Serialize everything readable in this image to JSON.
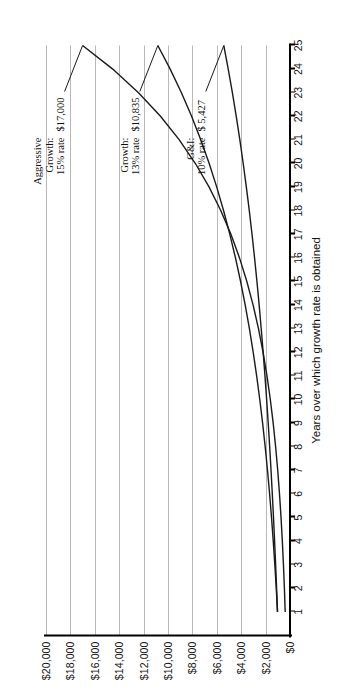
{
  "chart_data": {
    "type": "line",
    "title": "",
    "xlabel": "Years over which growth rate is obtained",
    "ylabel": "",
    "xlim": [
      0,
      25
    ],
    "ylim": [
      0,
      20000
    ],
    "grid": true,
    "legend_position": "inline-annotations",
    "x": [
      1,
      2,
      3,
      4,
      5,
      6,
      7,
      8,
      9,
      10,
      11,
      12,
      13,
      14,
      15,
      16,
      17,
      18,
      19,
      20,
      21,
      22,
      23,
      24,
      25
    ],
    "xtick_labels": [
      "1",
      "2",
      "3",
      "4",
      "5",
      "6",
      "7",
      "8",
      "9",
      "10",
      "11",
      "12",
      "13",
      "14",
      "15",
      "16",
      "17",
      "18",
      "19",
      "20",
      "21",
      "22",
      "23",
      "24",
      "25"
    ],
    "ytick_labels": [
      "$0",
      "$2,000",
      "$4,000",
      "$6,000",
      "$8,000",
      "$10,000",
      "$12,000",
      "$14,000",
      "$16,000",
      "$18,000",
      "$20,000"
    ],
    "ytick_values": [
      0,
      2000,
      4000,
      6000,
      8000,
      10000,
      12000,
      14000,
      16000,
      18000,
      20000
    ],
    "series": [
      {
        "name": "Aggressive Growth",
        "rate_label": "15% rate",
        "rate": 15,
        "end_value_label": "$17,000",
        "end_value": 17000,
        "values": [
          1170,
          1369,
          1602,
          1874,
          2193,
          2566,
          3003,
          3514,
          4111,
          4810,
          5628,
          6585,
          7705,
          9015,
          10548,
          12341,
          14439,
          16894,
          19766,
          23126,
          27057,
          31657,
          37038,
          43335,
          50702
        ]
      },
      {
        "name": "Growth",
        "rate_label": "13% rate",
        "rate": 13,
        "end_value_label": "$10,835",
        "end_value": 10835,
        "values": [
          1103,
          1217,
          1343,
          1482,
          1635,
          1804,
          1991,
          2196,
          2423,
          2674,
          2950,
          3255,
          3591,
          3962,
          4372,
          4824,
          5323,
          5873,
          6480,
          7150,
          7890,
          8706,
          9607,
          10600,
          11696
        ]
      },
      {
        "name": "G&I",
        "rate_label": "10% rate",
        "rate": 10,
        "end_value_label": "$ 5,427",
        "end_value": 5427,
        "values": [
          1072,
          1149,
          1232,
          1320,
          1415,
          1517,
          1626,
          1743,
          1868,
          2003,
          2147,
          2301,
          2467,
          2644,
          2834,
          3038,
          3256,
          3490,
          3742,
          4011,
          4299,
          4608,
          4940,
          5295,
          5676
        ]
      }
    ],
    "annotations": [
      {
        "name": "aggressive-growth-annotation",
        "lines": [
          "Aggressive",
          "Growth:",
          "15% rate"
        ],
        "value": "$17,000"
      },
      {
        "name": "growth-annotation",
        "lines": [
          "Growth:",
          "13% rate"
        ],
        "value": "$10,835"
      },
      {
        "name": "gi-annotation",
        "lines": [
          "G&I:",
          "10% rate"
        ],
        "value": "$ 5,427"
      }
    ],
    "colors": {
      "line": "#1a1a1a",
      "grid": "#b8b8b8",
      "axis": "#000000",
      "text": "#111111",
      "background": "#ffffff"
    }
  }
}
